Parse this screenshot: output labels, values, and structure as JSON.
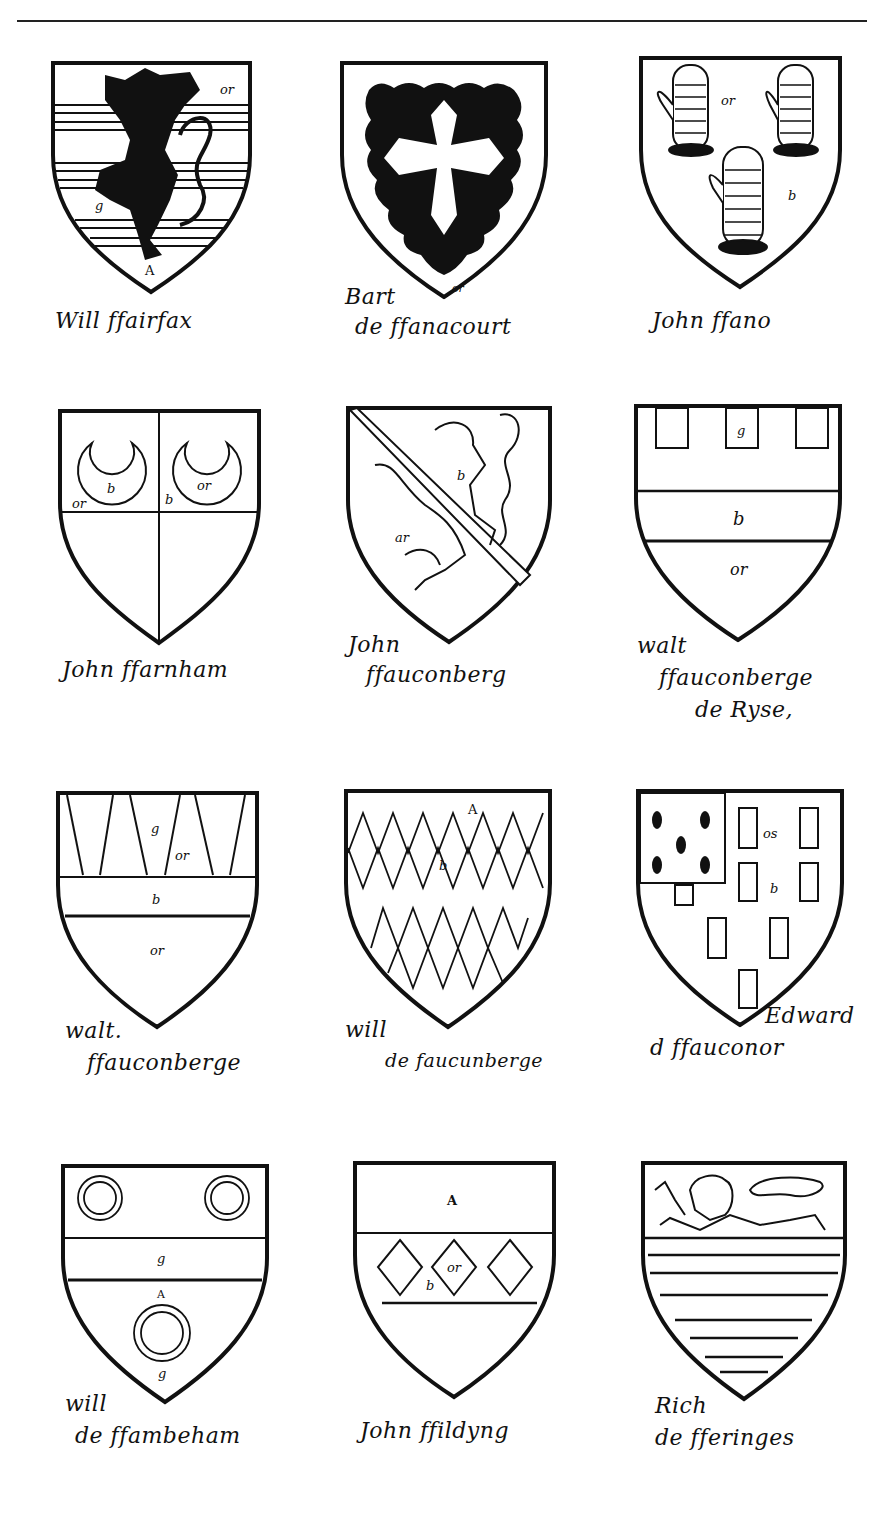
{
  "page": {
    "title_rule": true
  },
  "shields": [
    {
      "id": "fairfax",
      "caption_lines": [
        "Will ffairfax"
      ],
      "blazon_notes": [
        "or",
        "g",
        "A"
      ],
      "charge": "lion-rampant-over-barry"
    },
    {
      "id": "fanacourt",
      "caption_lines": [
        "Bart",
        "de ffanacourt"
      ],
      "blazon_notes": [
        "or"
      ],
      "charge": "cross-patonce-on-engrailed-field"
    },
    {
      "id": "fano",
      "caption_lines": [
        "John ffano"
      ],
      "blazon_notes": [
        "or",
        "b"
      ],
      "charge": "three-gauntlets"
    },
    {
      "id": "farnham",
      "caption_lines": [
        "John ffarnham"
      ],
      "blazon_notes": [
        "b",
        "or",
        "b",
        "or"
      ],
      "charge": "quarterly-with-crescents"
    },
    {
      "id": "fauconberg-john",
      "caption_lines": [
        "John",
        "ffauconberg"
      ],
      "blazon_notes": [
        "b",
        "ar"
      ],
      "charge": "lion-rampant-with-bendlet"
    },
    {
      "id": "fauconberge-rise",
      "caption_lines": [
        "walt",
        "ffauconberge",
        "de Ryse,"
      ],
      "blazon_notes": [
        "g",
        "b",
        "or"
      ],
      "charge": "chief-with-billets-and-fess"
    },
    {
      "id": "fauconberge-walt",
      "caption_lines": [
        "walt.",
        "ffauconberge"
      ],
      "blazon_notes": [
        "g",
        "or",
        "b",
        "or"
      ],
      "charge": "chief-indented-and-fess"
    },
    {
      "id": "faucunberge-will",
      "caption_lines": [
        "will",
        "de faucunberge"
      ],
      "blazon_notes": [
        "A",
        "b"
      ],
      "charge": "two-bars-lozengy"
    },
    {
      "id": "fauconer-edward",
      "caption_lines": [
        "Edward",
        "d ffauconor"
      ],
      "blazon_notes": [
        "or",
        "b"
      ],
      "charge": "billety-with-ermine-canton"
    },
    {
      "id": "fambeham",
      "caption_lines": [
        "will",
        "de ffambeham"
      ],
      "blazon_notes": [
        "g",
        "A",
        "g"
      ],
      "charge": "fess-between-three-annulets"
    },
    {
      "id": "filding",
      "caption_lines": [
        "John ffildyng"
      ],
      "blazon_notes": [
        "A",
        "b",
        "or"
      ],
      "charge": "fess-with-three-lozenges"
    },
    {
      "id": "feringes",
      "caption_lines": [
        "Rich",
        "de fferinges"
      ],
      "blazon_notes": [],
      "charge": "lion-passant-in-chief-over-barry"
    }
  ]
}
